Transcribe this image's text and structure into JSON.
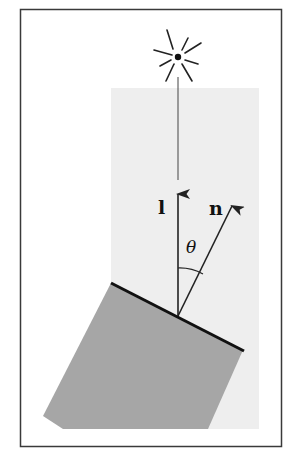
{
  "figure": {
    "labels": {
      "light_vector": "l",
      "normal_vector": "n",
      "angle": "θ"
    },
    "colors": {
      "frame": "#3a3a3a",
      "illuminated_region": "#eeeeee",
      "surface_block": "#a6a6a6",
      "surface_edge": "#111111",
      "vectors": "#222222",
      "light_source": "#222222"
    }
  }
}
